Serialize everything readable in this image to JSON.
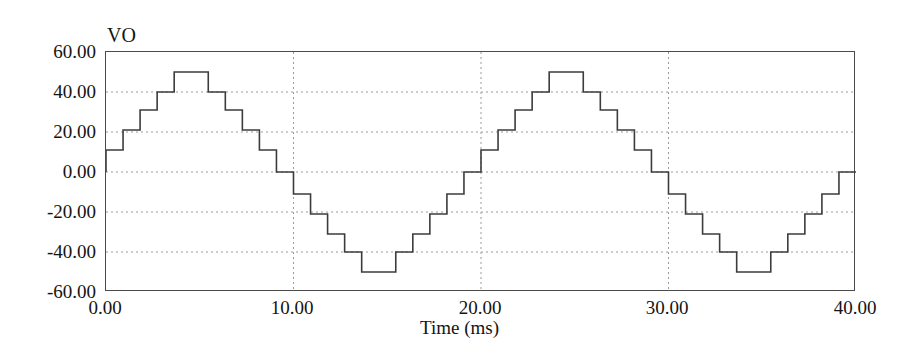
{
  "chart_data": {
    "type": "line",
    "title": "",
    "subtitle": "",
    "series_label": "VO",
    "xlabel": "Time (ms)",
    "ylabel": "VO",
    "xlim": [
      0,
      40
    ],
    "ylim": [
      -60,
      60
    ],
    "xticks": [
      0,
      10,
      20,
      30,
      40
    ],
    "xtick_labels": [
      "0.00",
      "10.00",
      "20.00",
      "30.00",
      "40.00"
    ],
    "yticks": [
      60,
      40,
      20,
      0,
      -20,
      -40,
      -60
    ],
    "ytick_labels": [
      "60.00",
      "40.00",
      "20.00",
      "0.00",
      "-20.00",
      "-40.00",
      "-60.00"
    ],
    "grid": true,
    "grid_style": "dotted",
    "grid_color": "#9a9a9a",
    "line_color": "#3c3c3c",
    "line_width": 1.6,
    "legend": false,
    "step_levels_per_cycle": [
      11,
      21,
      31,
      40,
      50,
      50,
      40,
      31,
      21,
      11,
      0,
      -11,
      -21,
      -31,
      -40,
      -50,
      -50,
      -40,
      -31,
      -21,
      -11,
      0
    ],
    "period_ms": 20,
    "cycles": 2,
    "step_duration_ms": 0.833,
    "x": [
      0.0,
      0.42,
      0.42,
      2.08,
      2.08,
      3.33,
      3.33,
      4.58,
      4.58,
      5.83,
      5.83,
      7.5,
      7.5,
      8.75,
      8.75,
      10.0,
      10.0,
      11.25,
      11.25,
      12.5,
      12.5,
      13.75,
      13.75,
      16.25,
      16.25,
      17.5,
      17.5,
      18.75,
      18.75,
      20.0,
      20.0,
      20.42,
      20.42,
      22.08,
      22.08,
      23.33,
      23.33,
      24.58,
      24.58,
      25.83,
      25.83,
      27.5,
      27.5,
      28.75,
      28.75,
      30.0,
      30.0,
      31.25,
      31.25,
      32.5,
      32.5,
      33.75,
      33.75,
      36.25,
      36.25,
      37.5,
      37.5,
      38.75,
      38.75,
      40.0
    ],
    "y": [
      0,
      0,
      11,
      11,
      21,
      21,
      31,
      31,
      40,
      40,
      50,
      50,
      40,
      40,
      31,
      31,
      21,
      21,
      11,
      11,
      0,
      0,
      -11,
      -11,
      -21,
      -21,
      -31,
      -31,
      -40,
      -40,
      -50,
      -50,
      -40,
      -40,
      -31,
      -31,
      -21,
      -21,
      -11,
      -11,
      0,
      0,
      11,
      11,
      21,
      21,
      31,
      31,
      40,
      40,
      50,
      50,
      40,
      40,
      31,
      31,
      21,
      21,
      11,
      11
    ],
    "waveform_points": [
      {
        "t": 0.0,
        "v": 0
      },
      {
        "t": 0.42,
        "v": 11
      },
      {
        "t": 2.08,
        "v": 21
      },
      {
        "t": 3.33,
        "v": 31
      },
      {
        "t": 4.58,
        "v": 40
      },
      {
        "t": 5.83,
        "v": 50
      },
      {
        "t": 7.5,
        "v": 50
      },
      {
        "t": 8.75,
        "v": 40
      },
      {
        "t": 10.0,
        "v": 31
      },
      {
        "t": 11.25,
        "v": 21
      },
      {
        "t": 12.5,
        "v": 11
      },
      {
        "t": 13.33,
        "v": 0
      },
      {
        "t": 14.17,
        "v": -11
      },
      {
        "t": 15.83,
        "v": -21
      },
      {
        "t": 17.08,
        "v": -31
      },
      {
        "t": 18.33,
        "v": -40
      },
      {
        "t": 19.58,
        "v": -50
      },
      {
        "t": 20.0,
        "v": -50
      }
    ]
  }
}
